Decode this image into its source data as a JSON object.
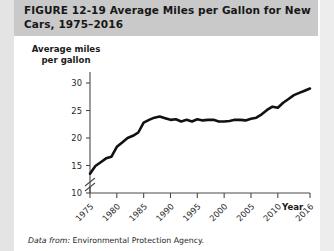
{
  "figure": {
    "label": "FIGURE",
    "number": "12-19",
    "title": "Average Miles per Gallon for New Cars, 1975–2016",
    "title_full": "FIGURE  12-19  Average Miles per Gallon for New Cars, 1975–2016",
    "source_lead": "Data from:",
    "source_text": "Environmental Protection Agency.",
    "band_color": "#c9c9c9",
    "line_color": "#111111"
  },
  "chart_data": {
    "type": "line",
    "title": "Average Miles per Gallon for New Cars, 1975–2016",
    "xlabel": "Year",
    "ylabel": "Average miles per gallon",
    "ylabel_line1": "Average miles",
    "ylabel_line2": "per gallon",
    "ylim": [
      10,
      32
    ],
    "xlim": [
      1975,
      2016
    ],
    "yticks": [
      10,
      15,
      20,
      25,
      30
    ],
    "ytick_labels": [
      "10",
      "15",
      "20",
      "25",
      "30"
    ],
    "xticks": [
      1975,
      1980,
      1985,
      1990,
      1995,
      2000,
      2005,
      2010,
      2016
    ],
    "xtick_labels": [
      "1975",
      "1980",
      "1985",
      "1990",
      "1995",
      "2000",
      "2005",
      "2010",
      "2016"
    ],
    "axis_break": true,
    "axis_break_note": "y-axis broken below 10",
    "grid": false,
    "legend": null,
    "series": [
      {
        "name": "Average miles per gallon",
        "x": [
          1975,
          1976,
          1977,
          1978,
          1979,
          1980,
          1981,
          1982,
          1983,
          1984,
          1985,
          1986,
          1987,
          1988,
          1989,
          1990,
          1991,
          1992,
          1993,
          1994,
          1995,
          1996,
          1997,
          1998,
          1999,
          2000,
          2001,
          2002,
          2003,
          2004,
          2005,
          2006,
          2007,
          2008,
          2009,
          2010,
          2011,
          2012,
          2013,
          2014,
          2015,
          2016
        ],
        "values": [
          13.5,
          14.9,
          15.6,
          16.3,
          16.6,
          18.4,
          19.2,
          20.0,
          20.4,
          21.0,
          22.8,
          23.3,
          23.7,
          23.9,
          23.6,
          23.3,
          23.4,
          23.0,
          23.3,
          23.0,
          23.4,
          23.2,
          23.3,
          23.3,
          23.0,
          23.0,
          23.1,
          23.3,
          23.3,
          23.2,
          23.5,
          23.7,
          24.3,
          25.1,
          25.7,
          25.5,
          26.4,
          27.1,
          27.8,
          28.2,
          28.6,
          29.0
        ]
      }
    ]
  }
}
